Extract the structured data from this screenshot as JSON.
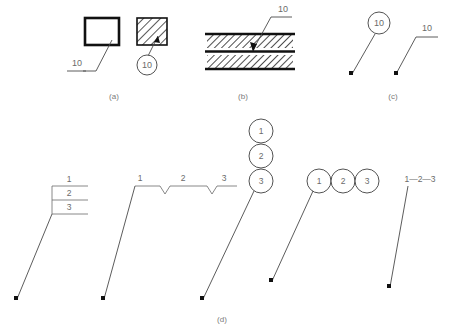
{
  "figure": {
    "captions": [
      {
        "id": "a",
        "label": "(a)"
      },
      {
        "id": "b",
        "label": "(b)"
      },
      {
        "id": "c",
        "label": "(c)"
      },
      {
        "id": "d",
        "label": "(d)"
      }
    ]
  },
  "panel_a": {
    "caption": "(a)",
    "plain_part": {
      "reference_numeral": "10",
      "shape": "rectangle-outline",
      "leader_style": "underlined-shelf"
    },
    "hatched_part": {
      "reference_numeral": "10",
      "shape": "hatched-rectangle",
      "leader_style": "circled-balloon"
    }
  },
  "panel_b": {
    "caption": "(b)",
    "reference_numeral": "10",
    "shape": "layered-section",
    "layers": [
      "hatched-upper",
      "solid-middle",
      "hatched-lower"
    ],
    "leader_style": "arrowhead-to-layer"
  },
  "panel_c": {
    "caption": "(c)",
    "left": {
      "reference_numeral": "10",
      "leader_style": "circled-balloon-with-dot"
    },
    "right": {
      "reference_numeral": "10",
      "leader_style": "underlined-shelf-with-dot"
    }
  },
  "panel_d": {
    "caption": "(d)",
    "variants": [
      {
        "id": "stacked-box",
        "style": "stacked-shelf-box",
        "numerals": [
          "1",
          "2",
          "3"
        ]
      },
      {
        "id": "inline-notched",
        "style": "horizontal-shelf-with-v-notches",
        "numerals": [
          "1",
          "2",
          "3"
        ]
      },
      {
        "id": "vertical-balloons",
        "style": "vertical-circle-stack",
        "numerals": [
          "1",
          "2",
          "3"
        ]
      },
      {
        "id": "horizontal-balloons",
        "style": "horizontal-circle-row",
        "numerals": [
          "1",
          "2",
          "3"
        ]
      },
      {
        "id": "dash-separated",
        "style": "dash-separated-text",
        "numerals": [
          "1",
          "2",
          "3"
        ],
        "separator": "—",
        "text": "1—2—3"
      }
    ]
  },
  "colors": {
    "line": "#4a4a4a",
    "heavy_line": "#111111",
    "text": "#6b6b6b",
    "caption": "#7a7a7a",
    "background": "#ffffff"
  }
}
